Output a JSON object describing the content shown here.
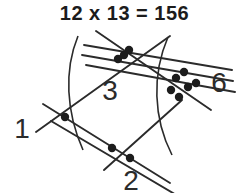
{
  "equation": {
    "text": "12 x 13 = 156",
    "multiplicand": "12",
    "operator": "x",
    "multiplier": "13",
    "result": "156"
  },
  "colors": {
    "background": "#ffffff",
    "line": "#2b2b2b",
    "dot": "#1c1c1c",
    "text": "#1c1c1c",
    "label": "#2b2b2b"
  },
  "diagram": {
    "type": "line-multiplication-lattice",
    "group_labels": [
      {
        "id": "ones-left",
        "text": "1",
        "x": 22,
        "y": 128,
        "dot_count": 1
      },
      {
        "id": "middle-top",
        "text": "3",
        "x": 110,
        "y": 100,
        "dot_count": 3
      },
      {
        "id": "right",
        "text": "6",
        "x": 216,
        "y": 92,
        "dot_count": 6
      },
      {
        "id": "bottom",
        "text": "2",
        "x": 130,
        "y": 189,
        "dot_count": 2
      }
    ],
    "line_groups": [
      {
        "name": "group-a-single",
        "count": 1,
        "direction": "down-right"
      },
      {
        "name": "group-a-double",
        "count": 2,
        "direction": "down-right"
      },
      {
        "name": "group-b-single",
        "count": 1,
        "direction": "up-right"
      },
      {
        "name": "group-b-triple",
        "count": 3,
        "direction": "up-right"
      }
    ],
    "dots": [
      {
        "x": 65,
        "y": 117
      },
      {
        "x": 118,
        "y": 59
      },
      {
        "x": 129,
        "y": 50
      },
      {
        "x": 176,
        "y": 78
      },
      {
        "x": 184,
        "y": 72
      },
      {
        "x": 188,
        "y": 87
      },
      {
        "x": 171,
        "y": 90
      },
      {
        "x": 179,
        "y": 97
      },
      {
        "x": 196,
        "y": 83
      },
      {
        "x": 112,
        "y": 148
      },
      {
        "x": 130,
        "y": 158
      }
    ],
    "arcs": [
      {
        "name": "left-separator"
      },
      {
        "name": "right-separator"
      }
    ]
  }
}
